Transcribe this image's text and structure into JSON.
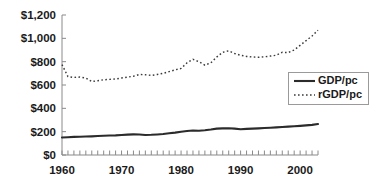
{
  "chart_data": {
    "type": "line",
    "title": "",
    "xlabel": "",
    "ylabel": "",
    "xlim": [
      1960,
      2003
    ],
    "ylim": [
      0,
      1200
    ],
    "grid": false,
    "legend_position": "right",
    "y_tick_labels": [
      "$0",
      "$200",
      "$400",
      "$600",
      "$800",
      "$1,000",
      "$1,200"
    ],
    "y_tick_values": [
      0,
      200,
      400,
      600,
      800,
      1000,
      1200
    ],
    "x_tick_labels": [
      "1960",
      "1970",
      "1980",
      "1990",
      "2000"
    ],
    "x_tick_values": [
      1960,
      1970,
      1980,
      1990,
      2000
    ],
    "x": [
      1960,
      1961,
      1962,
      1963,
      1964,
      1965,
      1966,
      1967,
      1968,
      1969,
      1970,
      1971,
      1972,
      1973,
      1974,
      1975,
      1976,
      1977,
      1978,
      1979,
      1980,
      1981,
      1982,
      1983,
      1984,
      1985,
      1986,
      1987,
      1988,
      1989,
      1990,
      1991,
      1992,
      1993,
      1994,
      1995,
      1996,
      1997,
      1998,
      1999,
      2000,
      2001,
      2002,
      2003
    ],
    "series": [
      {
        "name": "GDP/pc",
        "style": "solid",
        "color": "#2b2b2b",
        "values": [
          150,
          152,
          155,
          157,
          158,
          160,
          163,
          165,
          167,
          168,
          172,
          175,
          177,
          176,
          172,
          173,
          176,
          180,
          186,
          192,
          200,
          206,
          210,
          208,
          212,
          218,
          226,
          228,
          229,
          226,
          221,
          224,
          226,
          228,
          231,
          234,
          237,
          240,
          243,
          246,
          250,
          254,
          258,
          265
        ]
      },
      {
        "name": "rGDP/pc",
        "style": "dotted",
        "color": "#3a3a3a",
        "values": [
          775,
          672,
          665,
          668,
          660,
          630,
          636,
          645,
          648,
          652,
          660,
          668,
          675,
          690,
          688,
          682,
          690,
          700,
          715,
          730,
          742,
          790,
          820,
          800,
          770,
          790,
          840,
          880,
          893,
          870,
          855,
          845,
          840,
          838,
          842,
          848,
          855,
          880,
          878,
          900,
          940,
          980,
          1020,
          1070
        ]
      }
    ],
    "legend_entries": [
      {
        "label": "GDP/pc",
        "style": "solid"
      },
      {
        "label": "rGDP/pc",
        "style": "dotted"
      }
    ]
  }
}
